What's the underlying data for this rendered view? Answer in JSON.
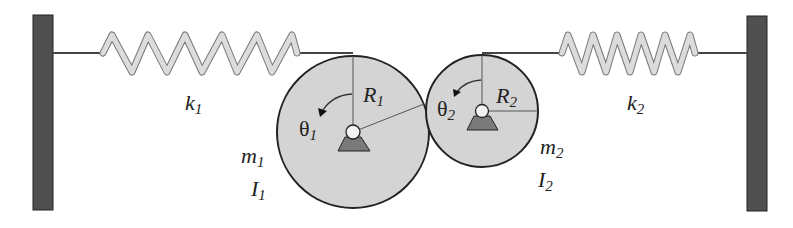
{
  "diagram": {
    "labels": {
      "k1": {
        "main": "k",
        "sub": "1"
      },
      "k2": {
        "main": "k",
        "sub": "2"
      },
      "R1": {
        "main": "R",
        "sub": "1"
      },
      "R2": {
        "main": "R",
        "sub": "2"
      },
      "theta1": {
        "main": "θ",
        "sub": "1"
      },
      "theta2": {
        "main": "θ",
        "sub": "2"
      },
      "m1": {
        "main": "m",
        "sub": "1"
      },
      "m2": {
        "main": "m",
        "sub": "2"
      },
      "I1": {
        "main": "I",
        "sub": "1"
      },
      "I2": {
        "main": "I",
        "sub": "2"
      }
    },
    "colors": {
      "wall": "#505050",
      "disk": "#d4d4d4",
      "spring": "#d8d8d8",
      "pivot_base": "#7a7a7a",
      "outline": "#222222"
    }
  }
}
